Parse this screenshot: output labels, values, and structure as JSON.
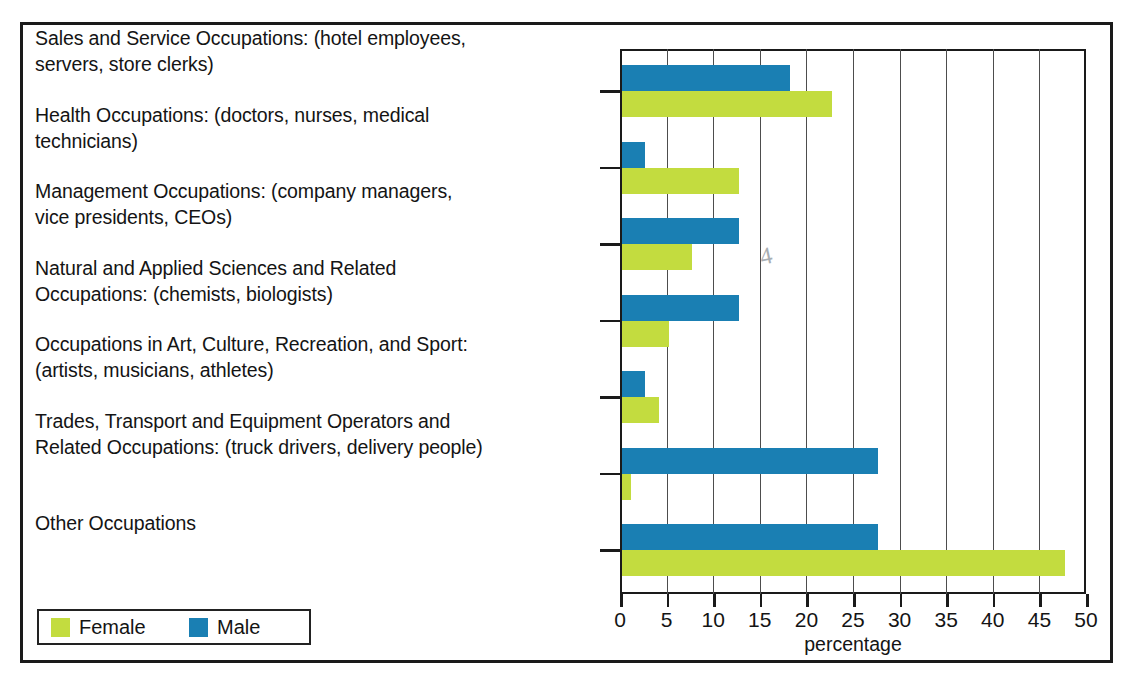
{
  "figure": {
    "title": "",
    "xlabel": "percentage",
    "legend": {
      "female_label": "Female",
      "male_label": "Male"
    },
    "colors": {
      "female": "#c3dc3f",
      "male": "#1a7fb3",
      "axis": "#1a1a1a",
      "grid": "#4d4d4d",
      "text": "#141414"
    },
    "pencil_marks": [
      "4"
    ]
  },
  "chart_data": {
    "type": "bar",
    "orientation": "horizontal",
    "title": "",
    "xlabel": "percentage",
    "ylabel": "",
    "xlim": [
      0,
      50
    ],
    "xticks": [
      0,
      5,
      10,
      15,
      20,
      25,
      30,
      35,
      40,
      45,
      50
    ],
    "xticklabels": [
      "0",
      "5",
      "10",
      "15",
      "20",
      "25",
      "30",
      "35",
      "40",
      "45",
      "50"
    ],
    "grid": true,
    "legend_position": "bottom-left",
    "categories": [
      "Sales and Service Occupations: (hotel employees, servers, store clerks)",
      "Health Occupations: (doctors, nurses, medical technicians)",
      "Management Occupations: (company managers, vice presidents, CEOs)",
      "Natural and Applied Sciences and Related Occupations: (chemists, biologists)",
      "Occupations in Art, Culture, Recreation, and Sport: (artists, musicians, athletes)",
      "Trades, Transport and Equipment Operators and Related Occupations: (truck drivers, delivery people)",
      "Other Occupations"
    ],
    "series": [
      {
        "name": "Male",
        "color": "#1a7fb3",
        "values": [
          18,
          2.5,
          12.5,
          12.5,
          2.5,
          27.5,
          27.5
        ]
      },
      {
        "name": "Female",
        "color": "#c3dc3f",
        "values": [
          22.5,
          12.5,
          7.5,
          5,
          4,
          1,
          47.5
        ]
      }
    ]
  },
  "labels": [
    {
      "line1": "Sales and Service Occupations: (hotel employees,",
      "line2": "servers, store clerks)"
    },
    {
      "line1": "Health Occupations: (doctors, nurses, medical",
      "line2": "technicians)"
    },
    {
      "line1": "Management Occupations: (company managers,",
      "line2": "vice presidents, CEOs)"
    },
    {
      "line1": "Natural and Applied Sciences and Related",
      "line2": "Occupations: (chemists, biologists)"
    },
    {
      "line1": "Occupations in Art, Culture, Recreation, and Sport:",
      "line2": "(artists, musicians, athletes)"
    },
    {
      "line1": "Trades, Transport and Equipment Operators and",
      "line2": "Related Occupations: (truck drivers, delivery people)"
    },
    {
      "line1": "Other Occupations",
      "line2": ""
    }
  ]
}
